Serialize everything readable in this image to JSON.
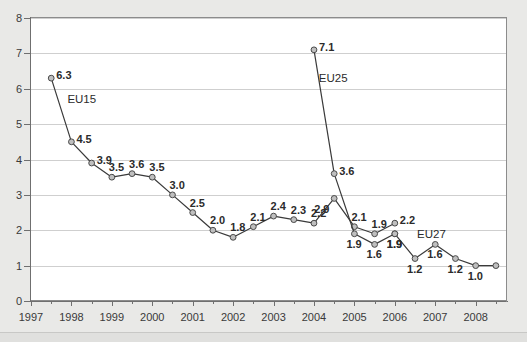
{
  "chart_data": {
    "type": "line",
    "title": "",
    "xlabel": "",
    "ylabel": "",
    "xlim": [
      1997,
      2008.75
    ],
    "ylim": [
      0,
      8
    ],
    "ytick_labels": [
      "0",
      "1",
      "2",
      "3",
      "4",
      "5",
      "6",
      "7",
      "8"
    ],
    "ytick_values": [
      0,
      1,
      2,
      3,
      4,
      5,
      6,
      7,
      8
    ],
    "xtick_labels": [
      "1997",
      "1998",
      "1999",
      "2000",
      "2001",
      "2002",
      "2003",
      "2004",
      "2005",
      "2006",
      "2007",
      "2008"
    ],
    "xtick_values": [
      1997,
      1998,
      1999,
      2000,
      2001,
      2002,
      2003,
      2004,
      2005,
      2006,
      2007,
      2008
    ],
    "grid": "horizontal",
    "legend": "inline-annotations",
    "marker": "open-circle",
    "series": [
      {
        "name": "EU15",
        "label_x": 1997.9,
        "label_y": 5.72,
        "color": "#3a3a3a",
        "x": [
          1997.5,
          1998.0,
          1998.5,
          1999.0,
          1999.5,
          2000.0,
          2000.5,
          2001.0,
          2001.5,
          2002.0,
          2002.5,
          2003.0,
          2003.5,
          2004.0,
          2004.5,
          2005.0,
          2005.5,
          2006.0
        ],
        "values": [
          6.3,
          4.5,
          3.9,
          3.5,
          3.6,
          3.5,
          3.0,
          2.5,
          2.0,
          1.8,
          2.1,
          2.4,
          2.3,
          2.2,
          2.9,
          2.1,
          1.9,
          2.2
        ],
        "value_labels": [
          "6.3",
          "4.5",
          "3.9",
          "3.5",
          "3.6",
          "3.5",
          "3.0",
          "2.5",
          "2.0",
          "1.8",
          "2.1",
          "2.4",
          "2.3",
          "2.2",
          "2.9",
          "2.1",
          "1.9",
          "2.2"
        ],
        "label_pos": [
          "right",
          "right",
          "right",
          "above",
          "above",
          "above",
          "above",
          "above",
          "above",
          "above",
          "above",
          "above",
          "above",
          "above",
          "below-left",
          "above",
          "above",
          "right"
        ]
      },
      {
        "name": "EU25",
        "label_x": 2004.12,
        "label_y": 6.3,
        "color": "#3a3a3a",
        "x": [
          2004.0,
          2004.5,
          2005.0,
          2005.5,
          2006.0
        ],
        "values": [
          7.1,
          3.6,
          1.9,
          1.6,
          1.9
        ],
        "value_labels": [
          "7.1",
          "3.6",
          "1.9",
          "1.6",
          "1.9"
        ],
        "label_pos": [
          "right",
          "right",
          "below",
          "below",
          "below"
        ]
      },
      {
        "name": "EU27",
        "label_x": 2006.55,
        "label_y": 1.9,
        "color": "#3a3a3a",
        "x": [
          2006.0,
          2006.5,
          2007.0,
          2007.5,
          2008.0,
          2008.5
        ],
        "values": [
          1.9,
          1.2,
          1.6,
          1.2,
          1.0,
          1.0
        ],
        "value_labels": [
          "1.9",
          "1.2",
          "1.6",
          "1.2",
          "1.0",
          ""
        ],
        "label_pos": [
          "below",
          "below",
          "below",
          "below",
          "below",
          "none"
        ]
      }
    ],
    "colors": {
      "line": "#3a3a3a",
      "marker_fill": "#bfbfbf",
      "marker_stroke": "#4a4a4a",
      "grid": "#cfcfcf",
      "axis": "#6f6f6f",
      "plot_background": "#ffffff",
      "page_background": "#e9e9e7",
      "text": "#2b2b2b"
    }
  }
}
